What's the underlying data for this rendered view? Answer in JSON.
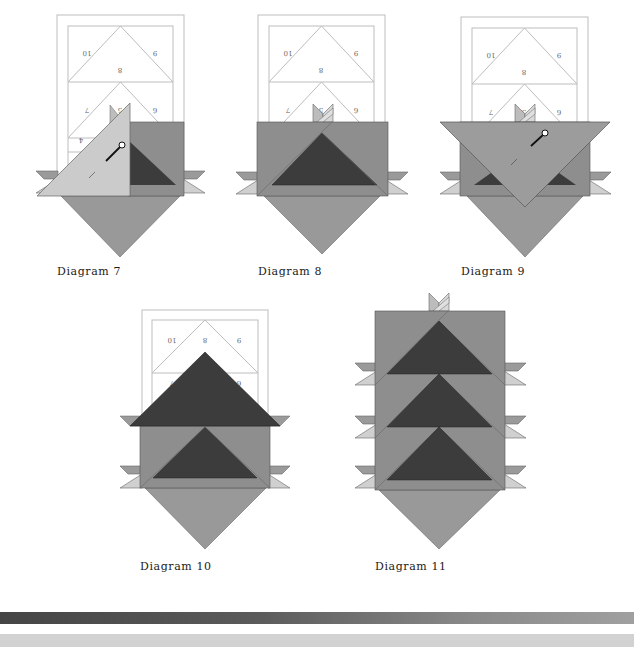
{
  "captions": {
    "d7": "Diagram 7",
    "d8": "Diagram 8",
    "d9": "Diagram 9",
    "d10": "Diagram 10",
    "d11": "Diagram 11"
  },
  "pattern_numbers": {
    "n10": "10",
    "n9": "9",
    "n8": "8",
    "n7": "7",
    "n6": "6",
    "n5": "5",
    "n4": "4"
  },
  "colors": {
    "frame_line": "#bdbdbd",
    "light_piece": "#cbcbcb",
    "mid_piece": "#8e8e8e",
    "diamond": "#999999",
    "dark_piece": "#3c3c3c",
    "flap_mid": "#9a9a9a",
    "flap_light": "#d0d0d0",
    "bar_dark_start": "#454545",
    "bar_dark_end": "#a0a0a0",
    "bar_light": "#d2d2d2"
  }
}
